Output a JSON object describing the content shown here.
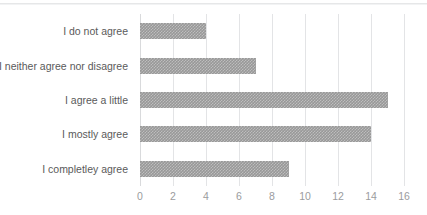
{
  "chart_data": {
    "type": "bar",
    "orientation": "horizontal",
    "title": "",
    "xlabel": "",
    "ylabel": "",
    "categories": [
      "I do not agree",
      "I neither agree nor disagree",
      "I agree a little",
      "I mostly agree",
      "I completley agree"
    ],
    "values": [
      4,
      7,
      15,
      14,
      9
    ],
    "xlim": [
      0,
      16
    ],
    "xticks": [
      0,
      2,
      4,
      6,
      8,
      10,
      12,
      14,
      16
    ],
    "xtick_labels": [
      "0",
      "2",
      "4",
      "6",
      "8",
      "10",
      "12",
      "14",
      "16"
    ],
    "grid": "vertical",
    "legend": "none",
    "bar_color": "#989898",
    "gridline_color": "#e3e4e6",
    "category_label_color": "#5a5a5a",
    "tick_label_color": "#9b9c9e"
  }
}
